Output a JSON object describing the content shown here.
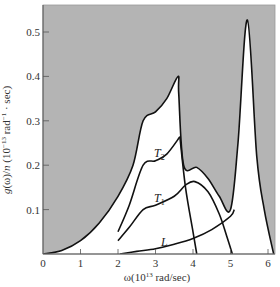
{
  "chart_data": {
    "type": "line",
    "title": "",
    "xlabel": "ω (10^13 rad/sec)",
    "ylabel": "g(ω)/n (10^-13 rad^-1 · sec)",
    "xlim": [
      0,
      6.2
    ],
    "ylim": [
      0,
      0.55
    ],
    "x_ticks": [
      "0",
      "1",
      "2",
      "3",
      "4",
      "5",
      "6"
    ],
    "y_ticks": [
      "0.1",
      "0.2",
      "0.3",
      "0.4",
      "0.5"
    ],
    "grid": false,
    "shaded_region": "area above total g(ω) envelope is shaded gray",
    "colors": {
      "shade": "#b4b4b4",
      "line": "#111111"
    },
    "series": [
      {
        "name": "Total",
        "x": [
          0,
          0.5,
          1.0,
          1.5,
          2.0,
          2.4,
          2.67,
          3.0,
          3.3,
          3.6,
          3.62,
          3.75,
          4.1,
          4.4,
          4.7,
          5.0,
          5.2,
          5.45,
          5.7,
          5.9,
          6.15
        ],
        "y": [
          0,
          0.008,
          0.03,
          0.07,
          0.13,
          0.2,
          0.3,
          0.32,
          0.35,
          0.4,
          0.36,
          0.2,
          0.195,
          0.17,
          0.13,
          0.1,
          0.25,
          0.527,
          0.22,
          0.1,
          0
        ]
      },
      {
        "name": "T2",
        "label": "T2",
        "x": [
          2.0,
          2.3,
          2.67,
          3.0,
          3.3,
          3.65
        ],
        "y": [
          0.05,
          0.11,
          0.2,
          0.21,
          0.225,
          0.264
        ]
      },
      {
        "name": "T1",
        "label": "T1",
        "x": [
          2.0,
          2.3,
          2.67,
          3.0,
          3.5,
          3.8,
          4.05,
          4.4,
          4.7,
          4.9,
          5.05
        ],
        "y": [
          0.03,
          0.06,
          0.1,
          0.11,
          0.13,
          0.155,
          0.163,
          0.14,
          0.09,
          0.04,
          0
        ]
      },
      {
        "name": "L",
        "label": "L",
        "x": [
          2.05,
          2.5,
          3.0,
          3.5,
          4.0,
          4.5,
          5.0,
          5.1
        ],
        "y": [
          0,
          0.006,
          0.012,
          0.022,
          0.035,
          0.055,
          0.085,
          0.1
        ]
      },
      {
        "name": "T2 drop",
        "x": [
          3.65,
          3.8,
          4.0,
          4.1
        ],
        "y": [
          0.264,
          0.15,
          0.05,
          0
        ]
      }
    ]
  }
}
